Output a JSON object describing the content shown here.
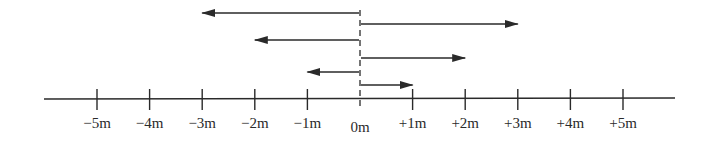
{
  "diagram": {
    "type": "number-line-displacement",
    "colors": {
      "line": "#2a2a2a",
      "background": "#ffffff"
    },
    "axis": {
      "unit": "m",
      "origin_label": "0m",
      "ticks": [
        {
          "value": -5,
          "label": "−5m"
        },
        {
          "value": -4,
          "label": "−4m"
        },
        {
          "value": -3,
          "label": "−3m"
        },
        {
          "value": -2,
          "label": "−2m"
        },
        {
          "value": -1,
          "label": "−1m"
        },
        {
          "value": 0,
          "label": "0m"
        },
        {
          "value": 1,
          "label": "+1m"
        },
        {
          "value": 2,
          "label": "+2m"
        },
        {
          "value": 3,
          "label": "+3m"
        },
        {
          "value": 4,
          "label": "+4m"
        },
        {
          "value": 5,
          "label": "+5m"
        }
      ]
    },
    "arrows": [
      {
        "from": 0,
        "to": -3,
        "direction": "left"
      },
      {
        "from": 0,
        "to": 3,
        "direction": "right"
      },
      {
        "from": 0,
        "to": -2,
        "direction": "left"
      },
      {
        "from": 0,
        "to": 2,
        "direction": "right"
      },
      {
        "from": 0,
        "to": -1,
        "direction": "left"
      },
      {
        "from": 0,
        "to": 1,
        "direction": "right"
      }
    ]
  }
}
